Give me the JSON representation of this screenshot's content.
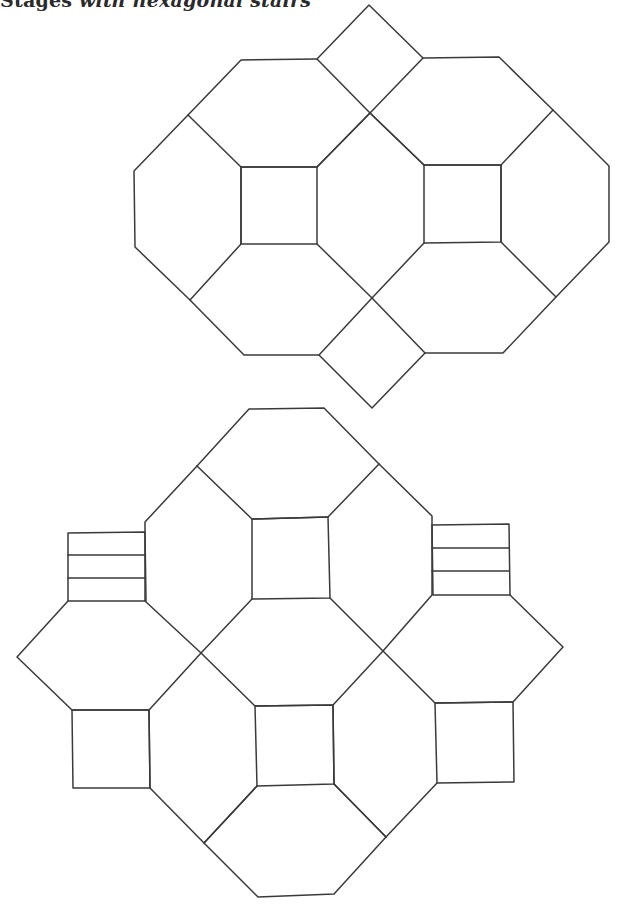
{
  "caption": {
    "lead": "Stages",
    "rest": " with hexagonal stairs"
  },
  "diagram": {
    "stroke_color": "#3a3a3a",
    "background": "#ffffff",
    "figures": [
      {
        "name": "top-layout",
        "description": "Two octagons with central squares, joined by diamond-shaped squares at top and bottom",
        "squares": 2,
        "diamonds": 2
      },
      {
        "name": "bottom-layout",
        "description": "Octagon-and-square tiling with hatched stair blocks at upper left and upper right",
        "squares": 4,
        "stair_blocks": 2,
        "stair_steps_per_block": 3
      }
    ]
  }
}
